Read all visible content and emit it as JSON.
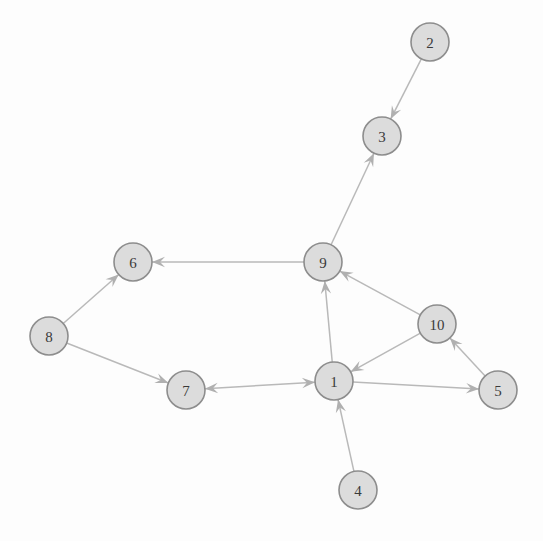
{
  "diagram": {
    "type": "directed-graph",
    "canvas": {
      "width": 543,
      "height": 541,
      "background": "#fdfdfd"
    },
    "style": {
      "node_fill": "#dcdcdc",
      "node_stroke": "#8d8d8d",
      "node_radius": 19,
      "edge_color": "#b9b9b9",
      "arrow_color": "#b0b0b0",
      "label_color": "#3a3a3a"
    },
    "nodes": [
      {
        "id": "1",
        "label": "1",
        "x": 334,
        "y": 381
      },
      {
        "id": "2",
        "label": "2",
        "x": 430,
        "y": 42
      },
      {
        "id": "3",
        "label": "3",
        "x": 382,
        "y": 136
      },
      {
        "id": "4",
        "label": "4",
        "x": 358,
        "y": 490
      },
      {
        "id": "5",
        "label": "5",
        "x": 498,
        "y": 390
      },
      {
        "id": "6",
        "label": "6",
        "x": 133,
        "y": 262
      },
      {
        "id": "7",
        "label": "7",
        "x": 186,
        "y": 390
      },
      {
        "id": "8",
        "label": "8",
        "x": 49,
        "y": 336
      },
      {
        "id": "9",
        "label": "9",
        "x": 323,
        "y": 262
      },
      {
        "id": "10",
        "label": "10",
        "x": 437,
        "y": 324
      }
    ],
    "edges": [
      {
        "from": "2",
        "to": "3",
        "directed": true,
        "bidirectional": false
      },
      {
        "from": "9",
        "to": "3",
        "directed": true,
        "bidirectional": false
      },
      {
        "from": "9",
        "to": "6",
        "directed": true,
        "bidirectional": false
      },
      {
        "from": "8",
        "to": "6",
        "directed": true,
        "bidirectional": false
      },
      {
        "from": "8",
        "to": "7",
        "directed": true,
        "bidirectional": false
      },
      {
        "from": "1",
        "to": "9",
        "directed": true,
        "bidirectional": false
      },
      {
        "from": "10",
        "to": "9",
        "directed": true,
        "bidirectional": false
      },
      {
        "from": "10",
        "to": "1",
        "directed": true,
        "bidirectional": false
      },
      {
        "from": "5",
        "to": "10",
        "directed": true,
        "bidirectional": false
      },
      {
        "from": "1",
        "to": "5",
        "directed": true,
        "bidirectional": false
      },
      {
        "from": "4",
        "to": "1",
        "directed": true,
        "bidirectional": false
      },
      {
        "from": "7",
        "to": "1",
        "directed": true,
        "bidirectional": true
      }
    ]
  }
}
